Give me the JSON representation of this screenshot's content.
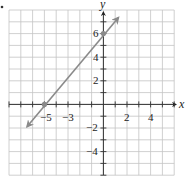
{
  "chart_data": {
    "type": "line",
    "title": "",
    "xlabel": "x",
    "ylabel": "y",
    "xlim": [
      -8,
      6
    ],
    "ylim": [
      -6,
      8
    ],
    "grid": true,
    "x_tick_labels": [
      {
        "value": -5,
        "label": "−5"
      },
      {
        "value": -3,
        "label": "−3"
      },
      {
        "value": 2,
        "label": "2"
      },
      {
        "value": 4,
        "label": "4"
      }
    ],
    "y_tick_labels": [
      {
        "value": 6,
        "label": "6"
      },
      {
        "value": 4,
        "label": "4"
      },
      {
        "value": 2,
        "label": "2"
      },
      {
        "value": -2,
        "label": "−2"
      },
      {
        "value": -4,
        "label": "−4"
      }
    ],
    "series": [
      {
        "name": "line",
        "equation": "y = (6/5)x + 6",
        "x": [
          -6.7,
          1.2
        ],
        "y": [
          -2.0,
          7.4
        ],
        "arrows_both_ends": true
      }
    ],
    "points": [
      {
        "x": -5,
        "y": 0
      },
      {
        "x": 0,
        "y": 6
      }
    ],
    "colors": {
      "line": "#8a8a8a",
      "point": "#8a8a8a",
      "axis": "#333333",
      "grid": "#c4c4c4"
    }
  },
  "labels": {
    "x_axis": "x",
    "y_axis": "y",
    "xt_m5": "−5",
    "xt_m3": "−3",
    "xt_2": "2",
    "xt_4": "4",
    "yt_6": "6",
    "yt_4": "4",
    "yt_2": "2",
    "yt_m2": "−2",
    "yt_m4": "−4"
  }
}
